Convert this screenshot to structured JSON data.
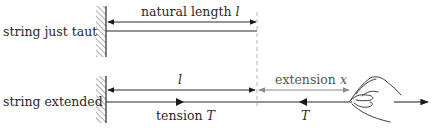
{
  "diagram": {
    "colors": {
      "line": "#2a2a2a",
      "grey_line": "#8a8a8a",
      "dashed": "#b5b5b5",
      "hatch": "#555555",
      "text": "#2a2a2a"
    },
    "rows": [
      {
        "label": "string just taut",
        "dimension": {
          "label": "natural length",
          "symbol": "l"
        }
      },
      {
        "label": "string extended",
        "dimension_left": {
          "label": "",
          "symbol": "l"
        },
        "dimension_right": {
          "label": "extension",
          "symbol": "x"
        },
        "tension_left": {
          "label": "tension",
          "symbol": "T"
        },
        "tension_right": {
          "label": "",
          "symbol": "T"
        }
      }
    ],
    "icons": {
      "wall": "hatched-wall-icon",
      "hand": "hand-pulling-icon",
      "pull_arrow": "right-arrow-icon"
    }
  }
}
